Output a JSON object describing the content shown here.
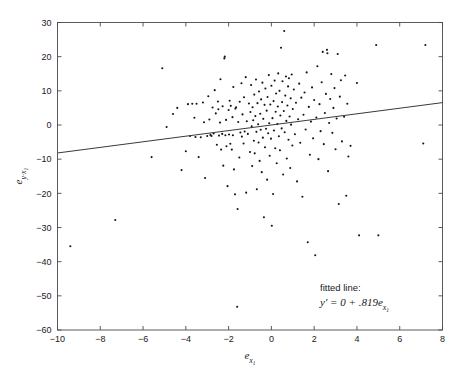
{
  "chart_data": {
    "type": "scatter",
    "title": "",
    "subtitle": "",
    "xlabel": "e_x",
    "ylabel": "e_y·x",
    "xlabel_base": "e",
    "xlabel_sub": "x",
    "xlabel_subsub": "1",
    "ylabel_base": "e",
    "ylabel_sub": "y·x",
    "ylabel_subsub": "1",
    "xlim": [
      -10,
      8
    ],
    "ylim": [
      -60,
      30
    ],
    "xticks": [
      -10,
      -8,
      -6,
      -4,
      -2,
      0,
      2,
      4,
      6,
      8
    ],
    "xtick_labels": [
      "−10",
      "−8",
      "−6",
      "−4",
      "−2",
      "0",
      "2",
      "4",
      "6",
      "8"
    ],
    "yticks": [
      -60,
      -50,
      -40,
      -30,
      -20,
      -10,
      0,
      10,
      20,
      30
    ],
    "ytick_labels": [
      "−60",
      "−50",
      "−40",
      "−30",
      "−20",
      "−10",
      "0",
      "10",
      "20",
      "30"
    ],
    "grid": false,
    "legend": "none",
    "marker_color": "#151515",
    "line_color": "#3a3a3a",
    "frame_color": "#4a4a4a",
    "background": "#ffffff",
    "fit": {
      "intercept": 0,
      "slope": 0.819,
      "x_start": -10,
      "x_end": 8,
      "y_start": -8.19,
      "y_end": 6.552
    },
    "annotation": {
      "line1": "fitted line:",
      "line2_prefix": "y′ = 0 + .819",
      "line2_var": "e",
      "line2_sub": "x",
      "line2_subsub": "1",
      "x": 2.0,
      "y": -47
    },
    "n_points": 218,
    "points": [
      [
        -9.4,
        -35.5
      ],
      [
        -7.3,
        -27.8
      ],
      [
        -5.6,
        -9.4
      ],
      [
        -5.1,
        16.6
      ],
      [
        -4.9,
        -0.6
      ],
      [
        -4.6,
        3.2
      ],
      [
        -4.4,
        5.0
      ],
      [
        -4.2,
        -13.2
      ],
      [
        -4.0,
        -7.7
      ],
      [
        -3.9,
        6.1
      ],
      [
        -3.8,
        -3.2
      ],
      [
        -3.7,
        6.2
      ],
      [
        -3.6,
        2.1
      ],
      [
        -3.55,
        -3.5
      ],
      [
        -3.5,
        6.2
      ],
      [
        -3.4,
        -9.4
      ],
      [
        -3.3,
        -3.6
      ],
      [
        -3.2,
        6.6
      ],
      [
        -3.15,
        0.8
      ],
      [
        -3.1,
        -15.5
      ],
      [
        -3.0,
        -3.2
      ],
      [
        -2.95,
        8.4
      ],
      [
        -2.9,
        1.6
      ],
      [
        -2.85,
        -2.9
      ],
      [
        -2.8,
        -3.2
      ],
      [
        -2.75,
        5.1
      ],
      [
        -2.7,
        -2.5
      ],
      [
        -2.65,
        10.2
      ],
      [
        -2.6,
        3.4
      ],
      [
        -2.55,
        -5.8
      ],
      [
        -2.5,
        6.9
      ],
      [
        -2.48,
        4.6
      ],
      [
        -2.45,
        -3.1
      ],
      [
        -2.4,
        0.7
      ],
      [
        -2.38,
        13.4
      ],
      [
        -2.35,
        -7.2
      ],
      [
        -2.3,
        -2.6
      ],
      [
        -2.28,
        5.5
      ],
      [
        -2.25,
        -11.9
      ],
      [
        -2.2,
        19.5
      ],
      [
        -2.18,
        20.0
      ],
      [
        -2.15,
        -3.0
      ],
      [
        -2.12,
        1.5
      ],
      [
        -2.1,
        -6.2
      ],
      [
        -2.05,
        -17.9
      ],
      [
        -2.0,
        4.4
      ],
      [
        -1.98,
        -2.8
      ],
      [
        -1.95,
        7.1
      ],
      [
        -1.92,
        -5.5
      ],
      [
        -1.9,
        5.6
      ],
      [
        -1.85,
        -7.2
      ],
      [
        -1.82,
        2.3
      ],
      [
        -1.8,
        -3.0
      ],
      [
        -1.78,
        11.1
      ],
      [
        -1.75,
        -13.0
      ],
      [
        -1.7,
        -20.3
      ],
      [
        -1.68,
        4.8
      ],
      [
        -1.65,
        5.2
      ],
      [
        -1.6,
        -53.2
      ],
      [
        -1.58,
        -24.6
      ],
      [
        -1.55,
        0.9
      ],
      [
        -1.5,
        -9.5
      ],
      [
        -1.48,
        6.8
      ],
      [
        -1.45,
        -2.2
      ],
      [
        -1.4,
        12.2
      ],
      [
        -1.38,
        -3.4
      ],
      [
        -1.35,
        3.1
      ],
      [
        -1.3,
        -5.4
      ],
      [
        -1.28,
        8.1
      ],
      [
        -1.25,
        -1.9
      ],
      [
        -1.2,
        14.0
      ],
      [
        -1.18,
        -19.8
      ],
      [
        -1.15,
        1.1
      ],
      [
        -1.1,
        -2.6
      ],
      [
        -1.05,
        6.3
      ],
      [
        -1.0,
        -7.9
      ],
      [
        -0.98,
        3.8
      ],
      [
        -0.95,
        11.7
      ],
      [
        -0.92,
        -0.4
      ],
      [
        -0.9,
        -12.0
      ],
      [
        -0.88,
        5.2
      ],
      [
        -0.85,
        1.4
      ],
      [
        -0.82,
        -4.6
      ],
      [
        -0.8,
        8.9
      ],
      [
        -0.78,
        -8.3
      ],
      [
        -0.75,
        2.6
      ],
      [
        -0.72,
        13.3
      ],
      [
        -0.7,
        -2.0
      ],
      [
        -0.68,
        -18.8
      ],
      [
        -0.65,
        6.4
      ],
      [
        -0.62,
        0.2
      ],
      [
        -0.6,
        -5.1
      ],
      [
        -0.58,
        9.8
      ],
      [
        -0.55,
        -10.5
      ],
      [
        -0.52,
        3.3
      ],
      [
        -0.5,
        -1.4
      ],
      [
        -0.48,
        7.5
      ],
      [
        -0.45,
        -13.8
      ],
      [
        -0.42,
        12.4
      ],
      [
        -0.4,
        -3.7
      ],
      [
        -0.38,
        1.8
      ],
      [
        -0.35,
        -27.0
      ],
      [
        -0.32,
        5.9
      ],
      [
        -0.3,
        -6.5
      ],
      [
        -0.28,
        10.7
      ],
      [
        -0.25,
        -1.1
      ],
      [
        -0.22,
        4.2
      ],
      [
        -0.2,
        -16.0
      ],
      [
        -0.18,
        8.2
      ],
      [
        -0.15,
        -2.4
      ],
      [
        -0.12,
        14.6
      ],
      [
        -0.1,
        0.5
      ],
      [
        -0.08,
        -9.0
      ],
      [
        -0.05,
        6.0
      ],
      [
        -0.02,
        -4.0
      ],
      [
        0.0,
        11.5
      ],
      [
        0.02,
        -29.5
      ],
      [
        0.05,
        2.0
      ],
      [
        0.08,
        -20.2
      ],
      [
        0.1,
        7.0
      ],
      [
        0.12,
        -1.6
      ],
      [
        0.15,
        13.0
      ],
      [
        0.18,
        -6.8
      ],
      [
        0.2,
        3.9
      ],
      [
        0.22,
        9.2
      ],
      [
        0.25,
        -11.2
      ],
      [
        0.28,
        0.3
      ],
      [
        0.3,
        5.4
      ],
      [
        0.32,
        15.1
      ],
      [
        0.35,
        -3.3
      ],
      [
        0.38,
        10.0
      ],
      [
        0.4,
        -7.4
      ],
      [
        0.42,
        2.8
      ],
      [
        0.45,
        22.6
      ],
      [
        0.48,
        -1.0
      ],
      [
        0.5,
        6.7
      ],
      [
        0.52,
        12.8
      ],
      [
        0.55,
        -14.5
      ],
      [
        0.58,
        4.1
      ],
      [
        0.6,
        27.5
      ],
      [
        0.62,
        -2.1
      ],
      [
        0.65,
        8.6
      ],
      [
        0.68,
        14.2
      ],
      [
        0.7,
        1.2
      ],
      [
        0.72,
        -9.8
      ],
      [
        0.75,
        5.7
      ],
      [
        0.78,
        11.3
      ],
      [
        0.8,
        -4.3
      ],
      [
        0.82,
        13.7
      ],
      [
        0.85,
        2.5
      ],
      [
        0.88,
        -12.6
      ],
      [
        0.9,
        7.8
      ],
      [
        0.92,
        0.1
      ],
      [
        0.95,
        14.8
      ],
      [
        0.98,
        -6.0
      ],
      [
        1.0,
        4.7
      ],
      [
        1.05,
        10.4
      ],
      [
        1.1,
        -2.7
      ],
      [
        1.15,
        6.5
      ],
      [
        1.2,
        -16.5
      ],
      [
        1.25,
        1.7
      ],
      [
        1.3,
        12.1
      ],
      [
        1.35,
        -5.2
      ],
      [
        1.4,
        8.0
      ],
      [
        1.45,
        -21.0
      ],
      [
        1.5,
        3.0
      ],
      [
        1.55,
        9.5
      ],
      [
        1.6,
        -1.3
      ],
      [
        1.65,
        15.4
      ],
      [
        1.7,
        -34.3
      ],
      [
        1.75,
        5.3
      ],
      [
        1.8,
        -8.7
      ],
      [
        1.85,
        1.0
      ],
      [
        1.9,
        11.0
      ],
      [
        1.95,
        -3.9
      ],
      [
        2.0,
        7.3
      ],
      [
        2.05,
        -38.1
      ],
      [
        2.1,
        2.2
      ],
      [
        2.15,
        17.2
      ],
      [
        2.2,
        -10.0
      ],
      [
        2.25,
        6.1
      ],
      [
        2.3,
        -1.8
      ],
      [
        2.35,
        12.5
      ],
      [
        2.4,
        21.4
      ],
      [
        2.45,
        -5.6
      ],
      [
        2.5,
        3.5
      ],
      [
        2.55,
        9.1
      ],
      [
        2.6,
        22.0
      ],
      [
        2.62,
        21.0
      ],
      [
        2.65,
        -13.5
      ],
      [
        2.7,
        0.6
      ],
      [
        2.75,
        7.6
      ],
      [
        2.8,
        14.9
      ],
      [
        2.85,
        -2.3
      ],
      [
        2.9,
        5.0
      ],
      [
        2.95,
        10.8
      ],
      [
        3.0,
        -7.1
      ],
      [
        3.05,
        1.9
      ],
      [
        3.1,
        20.8
      ],
      [
        3.15,
        -23.1
      ],
      [
        3.2,
        8.3
      ],
      [
        3.25,
        13.1
      ],
      [
        3.3,
        -4.8
      ],
      [
        3.4,
        2.4
      ],
      [
        3.45,
        14.5
      ],
      [
        3.5,
        -20.7
      ],
      [
        3.55,
        6.2
      ],
      [
        3.6,
        -9.2
      ],
      [
        3.7,
        -6.1
      ],
      [
        4.0,
        12.3
      ],
      [
        4.1,
        -32.3
      ],
      [
        4.9,
        23.4
      ],
      [
        5.0,
        -32.3
      ],
      [
        7.1,
        -5.4
      ],
      [
        7.2,
        23.4
      ]
    ]
  }
}
